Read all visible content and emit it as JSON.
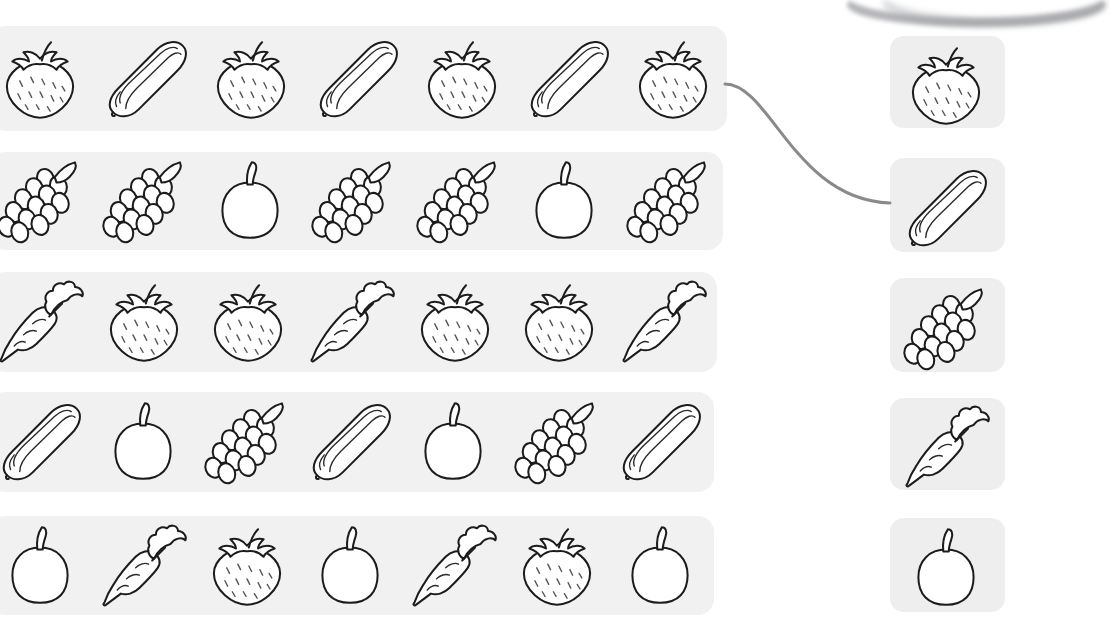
{
  "worksheet": {
    "title": "Fruit and vegetable pattern matching worksheet",
    "background_color": "#ffffff",
    "strip_color": "#f1f1f1",
    "card_color": "#eeeeee",
    "ink_color": "#1c1c1c",
    "connector_color": "#8a8a8e"
  },
  "icon_names": {
    "strawberry": "strawberry-icon",
    "cucumber": "cucumber-icon",
    "grapes": "grapes-icon",
    "carrot": "carrot-icon",
    "apple": "apple-icon"
  },
  "pattern_rows": [
    {
      "id": "row-1",
      "pattern_label": "AB",
      "items": [
        "strawberry",
        "cucumber",
        "strawberry",
        "cucumber",
        "strawberry",
        "cucumber",
        "strawberry"
      ],
      "connected_to": "answer-card-cucumber"
    },
    {
      "id": "row-2",
      "pattern_label": "AAB",
      "items": [
        "grapes",
        "grapes",
        "apple",
        "grapes",
        "grapes",
        "apple",
        "grapes"
      ],
      "connected_to": null
    },
    {
      "id": "row-3",
      "pattern_label": "ABB",
      "items": [
        "carrot",
        "strawberry",
        "strawberry",
        "carrot",
        "strawberry",
        "strawberry",
        "carrot"
      ],
      "connected_to": null
    },
    {
      "id": "row-4",
      "pattern_label": "ABC",
      "items": [
        "cucumber",
        "apple",
        "grapes",
        "cucumber",
        "apple",
        "grapes",
        "cucumber"
      ],
      "connected_to": null
    },
    {
      "id": "row-5",
      "pattern_label": "ABC",
      "items": [
        "apple",
        "carrot",
        "strawberry",
        "apple",
        "carrot",
        "strawberry",
        "apple"
      ],
      "connected_to": null
    }
  ],
  "answer_cards": [
    {
      "id": "answer-card-strawberry",
      "item": "strawberry"
    },
    {
      "id": "answer-card-cucumber",
      "item": "cucumber"
    },
    {
      "id": "answer-card-grapes",
      "item": "grapes"
    },
    {
      "id": "answer-card-carrot",
      "item": "carrot"
    },
    {
      "id": "answer-card-apple",
      "item": "apple"
    }
  ],
  "connectors": [
    {
      "id": "connector-row1-cucumber",
      "from_row": "row-1",
      "to_card": "answer-card-cucumber",
      "drawn": true
    }
  ]
}
